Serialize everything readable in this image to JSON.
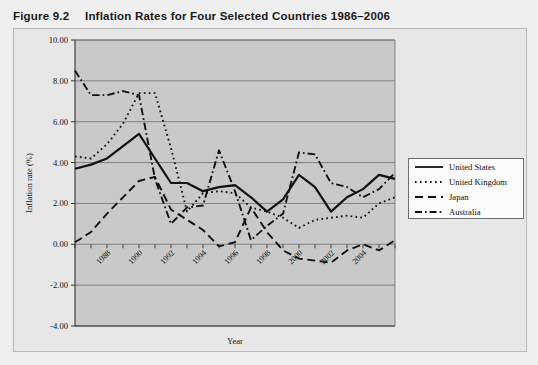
{
  "figure": {
    "number": "Figure 9.2",
    "title": "Inflation Rates for Four Selected Countries 1986–2006"
  },
  "chart_data": {
    "type": "line",
    "title": "Inflation Rates for Four Selected Countries 1986–2006",
    "xlabel": "Year",
    "ylabel": "Inflation rate (%)",
    "xlim": [
      1986,
      2006
    ],
    "ylim": [
      -4.0,
      10.0
    ],
    "yticks": [
      "10.00",
      "8.00",
      "6.00",
      "4.00",
      "2.00",
      "0.00",
      "-2.00",
      "-4.00"
    ],
    "ytick_values": [
      10.0,
      8.0,
      6.0,
      4.0,
      2.0,
      0.0,
      -2.0,
      -4.0
    ],
    "xticks": [
      "1988",
      "1990",
      "1992",
      "1994",
      "1996",
      "1998",
      "2000",
      "2002",
      "2004"
    ],
    "xtick_values": [
      1988,
      1990,
      1992,
      1994,
      1996,
      1998,
      2000,
      2002,
      2004
    ],
    "x": [
      1986,
      1987,
      1988,
      1989,
      1990,
      1991,
      1992,
      1993,
      1994,
      1995,
      1996,
      1997,
      1998,
      1999,
      2000,
      2001,
      2002,
      2003,
      2004,
      2005,
      2006
    ],
    "grid": true,
    "legend_position": "right",
    "series": [
      {
        "name": "United States",
        "style": "solid",
        "color": "#111111",
        "values": [
          3.7,
          3.9,
          4.2,
          4.8,
          5.4,
          4.2,
          3.0,
          3.0,
          2.6,
          2.8,
          2.9,
          2.3,
          1.6,
          2.2,
          3.4,
          2.8,
          1.6,
          2.3,
          2.7,
          3.4,
          3.2
        ]
      },
      {
        "name": "United Kingdom",
        "style": "dotted",
        "color": "#111111",
        "values": [
          4.3,
          4.2,
          4.9,
          5.9,
          7.4,
          7.4,
          4.7,
          1.6,
          2.5,
          2.6,
          2.5,
          1.8,
          1.6,
          1.3,
          0.8,
          1.2,
          1.3,
          1.4,
          1.3,
          2.0,
          2.3
        ]
      },
      {
        "name": "Japan",
        "style": "dashed",
        "color": "#111111",
        "values": [
          0.1,
          0.6,
          1.5,
          2.3,
          3.1,
          3.3,
          1.7,
          1.2,
          0.7,
          -0.1,
          0.1,
          1.8,
          0.6,
          -0.3,
          -0.7,
          -0.8,
          -0.9,
          -0.3,
          0.0,
          -0.3,
          0.2
        ]
      },
      {
        "name": "Australia",
        "style": "dashdot",
        "color": "#111111",
        "values": [
          8.5,
          7.3,
          7.3,
          7.5,
          7.3,
          3.2,
          1.0,
          1.8,
          1.9,
          4.6,
          2.6,
          0.2,
          0.9,
          1.5,
          4.5,
          4.4,
          3.0,
          2.8,
          2.3,
          2.7,
          3.5
        ]
      }
    ]
  },
  "legend": {
    "items": [
      {
        "label": "United States",
        "style": "solid"
      },
      {
        "label": "United Kingdom",
        "style": "dotted"
      },
      {
        "label": "Japan",
        "style": "dashed"
      },
      {
        "label": "Australia",
        "style": "dashdot"
      }
    ]
  }
}
